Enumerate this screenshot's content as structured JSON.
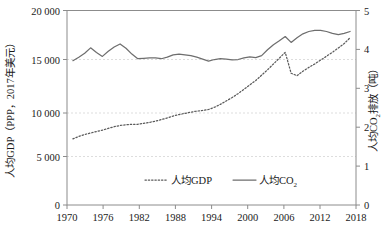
{
  "chart_data": {
    "type": "line",
    "title": "",
    "xlabel": "",
    "ylabel": "人均GDP（PPP，2017年美元）",
    "y2label": "人均CO₂排放（吨）",
    "grid": true,
    "legend_position": "bottom-center",
    "xlim": [
      1970,
      2019
    ],
    "ylim": [
      0,
      20000
    ],
    "y2lim": [
      0,
      5
    ],
    "xticks": [
      "1970",
      "1976",
      "1982",
      "1988",
      "1994",
      "2000",
      "2006",
      "2012",
      "2018"
    ],
    "xtick_values": [
      1970,
      1976,
      1982,
      1988,
      1994,
      2000,
      2006,
      2012,
      2018
    ],
    "yticks": [
      "0",
      "5 000",
      "10 000",
      "15 000",
      "20 000"
    ],
    "ytick_values": [
      0,
      5000,
      10000,
      15000,
      20000
    ],
    "y2ticks": [
      "0",
      "1",
      "2",
      "3",
      "4",
      "5"
    ],
    "y2tick_values": [
      0,
      1,
      2,
      3,
      4,
      5
    ],
    "x": [
      1971,
      1972,
      1973,
      1974,
      1975,
      1976,
      1977,
      1978,
      1979,
      1980,
      1981,
      1982,
      1983,
      1984,
      1985,
      1986,
      1987,
      1988,
      1989,
      1990,
      1991,
      1992,
      1993,
      1994,
      1995,
      1996,
      1997,
      1998,
      1999,
      2000,
      2001,
      2002,
      2003,
      2004,
      2005,
      2006,
      2007,
      2008,
      2009,
      2010,
      2011,
      2012,
      2013,
      2014,
      2015,
      2016,
      2017,
      2018
    ],
    "series": [
      {
        "name": "人均GDP",
        "axis": "left",
        "style": "dotted",
        "unit": "2017年美元 PPP",
        "color": "#5a5a5a",
        "values": [
          6800,
          7050,
          7250,
          7400,
          7550,
          7700,
          7880,
          8050,
          8180,
          8250,
          8300,
          8300,
          8400,
          8500,
          8620,
          8780,
          8950,
          9150,
          9300,
          9420,
          9550,
          9650,
          9720,
          9820,
          10050,
          10350,
          10700,
          11050,
          11450,
          11900,
          12350,
          12800,
          13350,
          13900,
          14500,
          15100,
          15700,
          13550,
          13300,
          13750,
          14150,
          14500,
          14900,
          15300,
          15700,
          16150,
          16600,
          17200
        ]
      },
      {
        "name": "人均CO₂",
        "axis": "right",
        "style": "solid",
        "unit": "吨",
        "color": "#6e6e6e",
        "values": [
          3.71,
          3.8,
          3.9,
          4.04,
          3.92,
          3.82,
          3.95,
          4.06,
          4.14,
          4.03,
          3.88,
          3.76,
          3.77,
          3.78,
          3.78,
          3.76,
          3.8,
          3.86,
          3.88,
          3.86,
          3.84,
          3.8,
          3.75,
          3.7,
          3.74,
          3.76,
          3.75,
          3.73,
          3.74,
          3.78,
          3.81,
          3.79,
          3.84,
          3.99,
          4.12,
          4.22,
          4.33,
          4.18,
          4.3,
          4.4,
          4.46,
          4.49,
          4.49,
          4.46,
          4.41,
          4.38,
          4.41,
          4.46
        ]
      }
    ]
  },
  "legend": {
    "items": [
      {
        "label": "人均GDP",
        "style": "dotted"
      },
      {
        "label": "人均CO",
        "sub": "2",
        "style": "solid"
      }
    ]
  },
  "axis_titles": {
    "left": "人均GDP（PPP，2017年美元）",
    "right_part1": "人均CO",
    "right_sub": "2",
    "right_part2": "排放（吨）"
  }
}
